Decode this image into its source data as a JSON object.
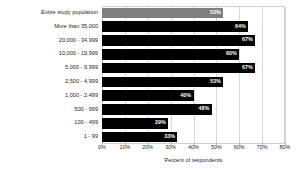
{
  "chart_data": {
    "type": "bar",
    "orientation": "horizontal",
    "title": "",
    "subtitle": "",
    "xlabel": "Percent of respondents",
    "ylabel": "",
    "xlim": [
      0,
      80
    ],
    "xticks": [
      0,
      10,
      20,
      30,
      40,
      50,
      60,
      70,
      80
    ],
    "xtick_labels": [
      "0%",
      "10%",
      "20%",
      "30%",
      "40%",
      "50%",
      "60%",
      "70%",
      "80%"
    ],
    "grid": true,
    "grid_axis": "x",
    "legend": false,
    "legend_position": "none",
    "categories": [
      "Entire study population",
      "More than 35,000",
      "20,000 - 34,999",
      "10,000 - 19,999",
      "5,000 - 9,999",
      "2,500 - 4,999",
      "1,000 - 2,499",
      "500 - 999",
      "100 - 499",
      "1 - 99"
    ],
    "values": [
      53,
      64,
      67,
      60,
      67,
      53,
      40,
      48,
      29,
      33
    ],
    "value_labels": [
      "53%",
      "64%",
      "67%",
      "60%",
      "67%",
      "53%",
      "40%",
      "48%",
      "29%",
      "33%"
    ],
    "bar_colors": [
      "#808080",
      "#000000",
      "#000000",
      "#000000",
      "#000000",
      "#000000",
      "#000000",
      "#000000",
      "#000000",
      "#000000"
    ],
    "highlight_category": "Entire study population",
    "highlight_color": "#808080",
    "series_color": "#000000",
    "background_color": "#ffffff",
    "grid_color": "#d9d9d9",
    "frame_color": "#cfcfcf",
    "text_color": "#231f20",
    "value_label_color": "#ffffff"
  }
}
